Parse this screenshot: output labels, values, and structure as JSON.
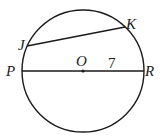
{
  "diagram": {
    "type": "circle-geometry",
    "center": {
      "label": "O"
    },
    "points": [
      {
        "label": "J"
      },
      {
        "label": "K"
      },
      {
        "label": "P"
      },
      {
        "label": "R"
      }
    ],
    "segments": [
      {
        "from": "J",
        "to": "K",
        "kind": "chord"
      },
      {
        "from": "P",
        "to": "R",
        "kind": "diameter"
      }
    ],
    "measurements": [
      {
        "segment": "OR",
        "value": "7"
      }
    ],
    "colors": {
      "stroke": "#1a1a1a",
      "background": "#ffffff"
    }
  }
}
